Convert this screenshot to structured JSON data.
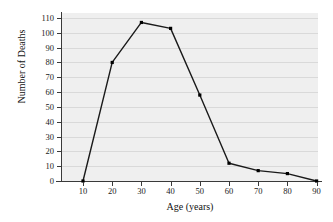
{
  "chart_data": {
    "type": "line",
    "title": "",
    "xlabel": "Age (years)",
    "ylabel": "Number of Deaths",
    "x": [
      10,
      20,
      30,
      40,
      50,
      60,
      70,
      80,
      90
    ],
    "values": [
      0,
      80,
      107,
      103,
      58,
      12,
      7,
      5,
      0
    ],
    "xtick_labels": [
      "10",
      "20",
      "30",
      "40",
      "50",
      "60",
      "70",
      "80",
      "90"
    ],
    "ytick_labels": [
      "0",
      "10",
      "20",
      "30",
      "40",
      "50",
      "60",
      "70",
      "80",
      "90",
      "100",
      "110"
    ],
    "yticks": [
      0,
      10,
      20,
      30,
      40,
      50,
      60,
      70,
      80,
      90,
      100,
      110
    ],
    "xlim": [
      5,
      95
    ],
    "ylim": [
      0,
      113
    ],
    "grid": true,
    "legend": false,
    "marker": "filled-square",
    "line_color": "#1a1a1a",
    "marker_color": "#000000",
    "plot_background": "#efefef",
    "gridline_color": "#d9d9d9",
    "axis_color": "#3a3a3a"
  }
}
